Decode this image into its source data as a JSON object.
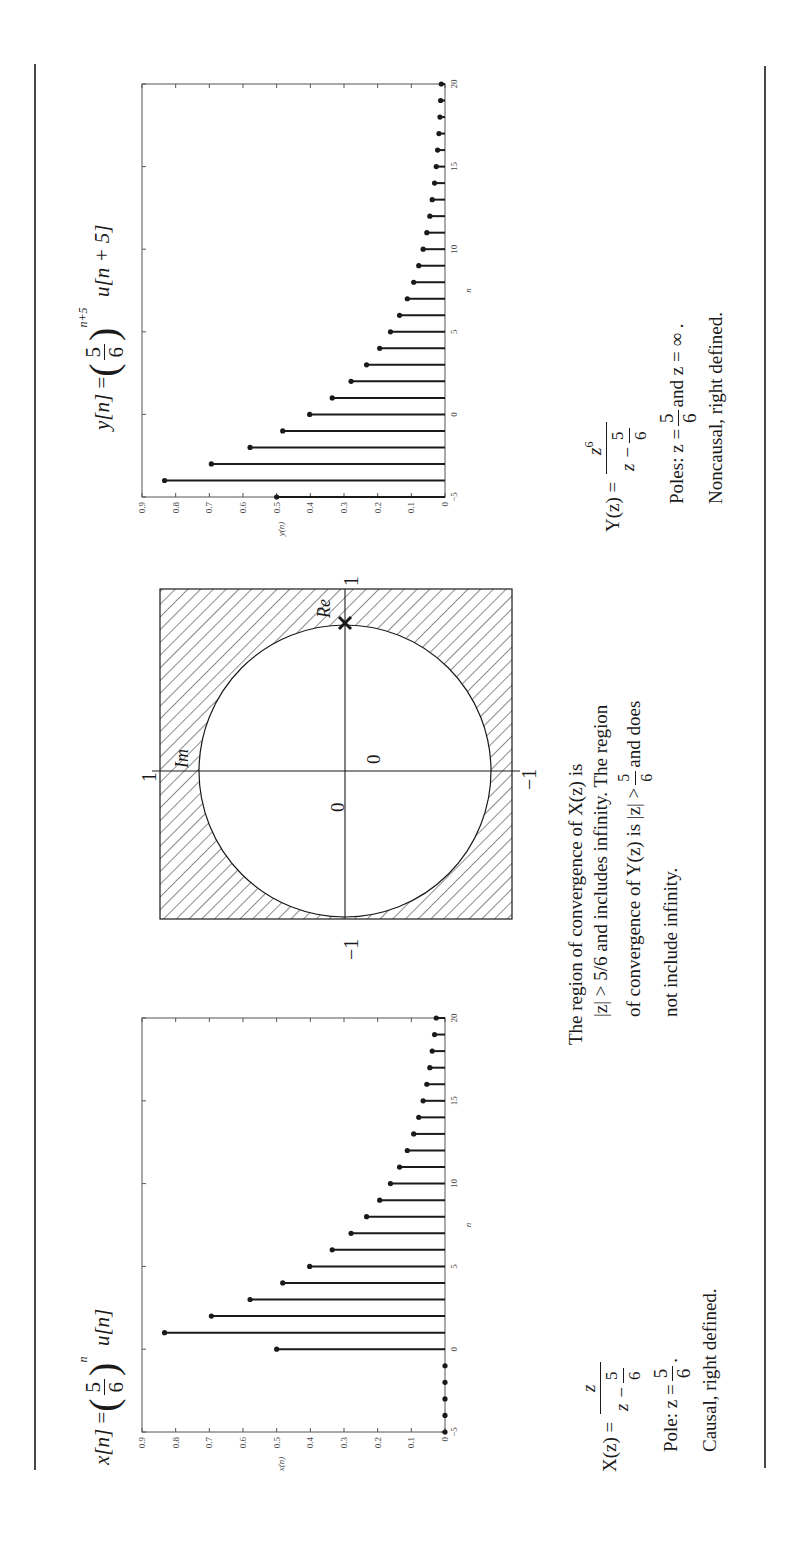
{
  "page": {
    "orientation": "rotated-90-ccw",
    "rule_color": "#1a1a1a"
  },
  "left_panel": {
    "signal_label": "x[n]",
    "signal_equals": "=",
    "signal_base_num": "5",
    "signal_base_den": "6",
    "signal_exponent": "n",
    "signal_step": "u[n]",
    "transform_label": "X(z)",
    "transform_equals": "=",
    "transform_num": "z",
    "transform_den_left": "z −",
    "transform_den_frac_num": "5",
    "transform_den_frac_den": "6",
    "pole_prefix": "Pole: z =",
    "pole_num": "5",
    "pole_den": "6",
    "pole_suffix": ".",
    "classification": "Causal, right defined."
  },
  "middle_panel": {
    "roc_line1": "The region of convergence of X(z) is",
    "roc_line2": "|z| > 5/6 and includes infinity. The region",
    "roc_line3_prefix": "of convergence of Y(z) is |z| >",
    "roc_line3_num": "5",
    "roc_line3_den": "6",
    "roc_line3_suffix": "and does",
    "roc_line4": "not include infinity.",
    "pole_zero": {
      "axis_re_label": "Re",
      "axis_im_label": "Im",
      "tick_re_pos": "1",
      "tick_re_neg": "−1",
      "tick_im_pos": "1",
      "tick_im_neg": "−1",
      "zero_label_1": "0",
      "zero_label_2": "0",
      "pole_marker": "×",
      "hatch_region": "outside unit circle"
    }
  },
  "right_panel": {
    "signal_label": "y[n]",
    "signal_equals": "=",
    "signal_base_num": "5",
    "signal_base_den": "6",
    "signal_exponent": "n+5",
    "signal_step": "u[n + 5]",
    "transform_label": "Y(z)",
    "transform_equals": "=",
    "transform_num": "z",
    "transform_num_exp": "6",
    "transform_den_left": "z −",
    "transform_den_frac_num": "5",
    "transform_den_frac_den": "6",
    "poles_prefix": "Poles:  z =",
    "poles_num": "5",
    "poles_den": "6",
    "poles_suffix": "and  z = ∞ .",
    "classification": "Noncausal, right defined."
  },
  "chart_data": [
    {
      "type": "stem",
      "title": "x[n] = (5/6)^n u[n]",
      "xlabel": "n",
      "ylabel": "x(n)",
      "xlim": [
        -5,
        20
      ],
      "ylim": [
        0,
        0.9
      ],
      "xticks": [
        "-5",
        "0",
        "5",
        "10",
        "15",
        "20"
      ],
      "yticks": [
        "0",
        "0.1",
        "0.2",
        "0.3",
        "0.4",
        "0.5",
        "0.6",
        "0.7",
        "0.8",
        "0.9"
      ],
      "grid": false,
      "x": [
        -5,
        -4,
        -3,
        -2,
        -1,
        0,
        1,
        2,
        3,
        4,
        5,
        6,
        7,
        8,
        9,
        10,
        11,
        12,
        13,
        14,
        15,
        16,
        17,
        18,
        19,
        20
      ],
      "values": [
        0,
        0,
        0,
        0,
        0,
        0.5,
        0.833,
        0.694,
        0.579,
        0.482,
        0.402,
        0.335,
        0.279,
        0.233,
        0.194,
        0.162,
        0.135,
        0.112,
        0.093,
        0.078,
        0.065,
        0.054,
        0.045,
        0.038,
        0.031,
        0.026
      ]
    },
    {
      "type": "stem",
      "title": "y[n] = (5/6)^(n+5) u[n+5]",
      "xlabel": "n",
      "ylabel": "y(n)",
      "xlim": [
        -5,
        20
      ],
      "ylim": [
        0,
        0.9
      ],
      "xticks": [
        "-5",
        "0",
        "5",
        "10",
        "15",
        "20"
      ],
      "yticks": [
        "0",
        "0.1",
        "0.2",
        "0.3",
        "0.4",
        "0.5",
        "0.6",
        "0.7",
        "0.8",
        "0.9"
      ],
      "grid": false,
      "x": [
        -5,
        -4,
        -3,
        -2,
        -1,
        0,
        1,
        2,
        3,
        4,
        5,
        6,
        7,
        8,
        9,
        10,
        11,
        12,
        13,
        14,
        15,
        16,
        17,
        18,
        19,
        20
      ],
      "values": [
        0.5,
        0.833,
        0.694,
        0.579,
        0.482,
        0.402,
        0.335,
        0.279,
        0.233,
        0.194,
        0.162,
        0.135,
        0.112,
        0.093,
        0.078,
        0.065,
        0.054,
        0.045,
        0.038,
        0.031,
        0.026,
        0.022,
        0.018,
        0.015,
        0.013,
        0.011
      ]
    }
  ]
}
